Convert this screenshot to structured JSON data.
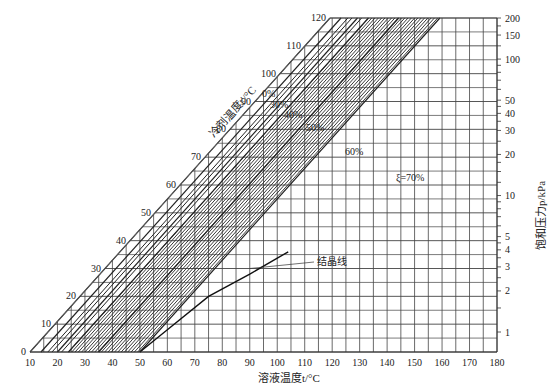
{
  "chart_data": {
    "type": "line",
    "title": "",
    "xlabel": "溶液温度t/°C",
    "ylabel_left_diagonal": "冷剂温度t'/°C",
    "ylabel_right": "饱和压力p/kPa",
    "x_ticks": [
      10,
      20,
      30,
      40,
      50,
      60,
      70,
      80,
      90,
      100,
      110,
      120,
      130,
      140,
      150,
      160,
      170,
      180
    ],
    "x_range": [
      10,
      180
    ],
    "refrigerant_ticks": [
      0,
      10,
      20,
      30,
      40,
      50,
      60,
      70,
      80,
      90,
      100,
      110,
      120
    ],
    "refrigerant_range": [
      0,
      120
    ],
    "pressure_ticks": [
      1,
      2,
      3,
      4,
      5,
      10,
      20,
      30,
      40,
      50,
      100,
      150,
      200
    ],
    "pressure_scale": "log",
    "grid": true,
    "series": [
      {
        "name": "0%",
        "label": "0%",
        "x_at_t0": 10
      },
      {
        "name": "30%",
        "label": "30%",
        "x_at_t0": 14
      },
      {
        "name": "40%",
        "label": "40%",
        "x_at_t0": 20
      },
      {
        "name": "50%",
        "label": "50%",
        "x_at_t0": 24
      },
      {
        "name": "60%",
        "label": "60%",
        "x_at_t0": 35
      },
      {
        "name": "70%",
        "label": "ξ=70%",
        "x_at_t0": 50
      }
    ],
    "concentration_step_lines": "1% increments between 45% and 70%",
    "annotations": [
      {
        "text": "结晶线",
        "meaning": "crystallization line",
        "x": 95,
        "y_refrigerant": 30
      }
    ]
  },
  "labels": {
    "xlabel": "溶液温度t/°C",
    "left_axis": "冷剂温度t'/°C",
    "right_axis": "饱和压力p/kPa",
    "crystal": "结晶线",
    "c0": "0%",
    "c30": "30%",
    "c40": "40%",
    "c50": "50%",
    "c60": "60%",
    "c70": "ξ=70%"
  }
}
